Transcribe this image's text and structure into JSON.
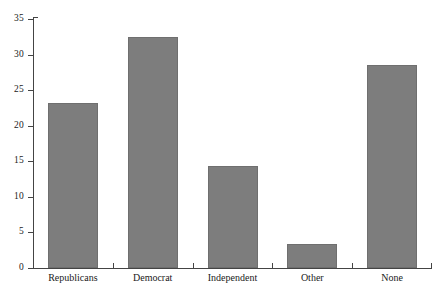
{
  "chart_data": {
    "type": "bar",
    "title": "",
    "subtitle": "",
    "xlabel": "",
    "ylabel": "",
    "categories": [
      "Republicans",
      "Democrat",
      "Independent",
      "Other",
      "None"
    ],
    "values": [
      23.2,
      32.5,
      14.3,
      3.4,
      28.5
    ],
    "ylim": [
      0,
      35
    ],
    "yticks": [
      0,
      5,
      10,
      15,
      20,
      25,
      30,
      35
    ],
    "ytick_labels": [
      "0",
      "5",
      "10",
      "15",
      "20",
      "25",
      "30",
      "35"
    ],
    "grid": false,
    "legend": null,
    "legend_position": "none",
    "bar_color": "#7d7d7d",
    "bar_edge_color": "#6f6f6f",
    "axis_color": "#444444",
    "background_color": "#ffffff",
    "text_color": "#1a1a1a"
  }
}
